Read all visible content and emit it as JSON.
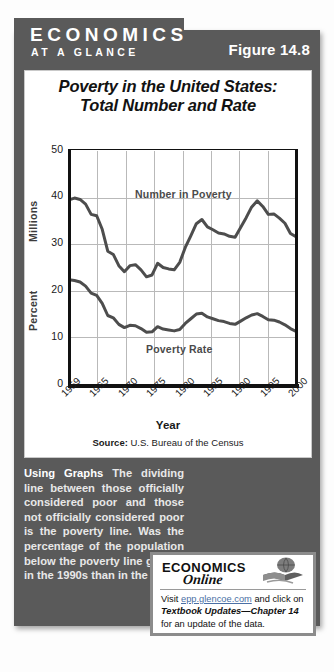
{
  "banner": {
    "title_line1": "ECONOMICS",
    "title_line2": "AT A GLANCE",
    "figure_label": "Figure 14.8"
  },
  "chart_card": {
    "title_line1": "Poverty in the United States:",
    "title_line2": "Total Number and Rate",
    "source_prefix": "Source:",
    "source_text": " U.S. Bureau of the Census"
  },
  "chart_data": {
    "type": "line",
    "title": "Poverty in the United States: Total Number and Rate",
    "xlabel": "Year",
    "ylabel_upper": "Millions",
    "ylabel_lower": "Percent",
    "ylim": [
      0,
      50
    ],
    "yticks": [
      50,
      40,
      30,
      20,
      10,
      0
    ],
    "xlim": [
      1959,
      2000
    ],
    "xticks": [
      1959,
      1965,
      1970,
      1975,
      1980,
      1985,
      1990,
      1995,
      2000
    ],
    "grid": true,
    "legend": "inline-annotations",
    "series": [
      {
        "name": "Number in Poverty",
        "unit": "Millions",
        "color": "#4d4d4d",
        "x": [
          1959,
          1960,
          1961,
          1962,
          1963,
          1964,
          1965,
          1966,
          1967,
          1968,
          1969,
          1970,
          1971,
          1972,
          1973,
          1974,
          1975,
          1976,
          1977,
          1978,
          1979,
          1980,
          1981,
          1982,
          1983,
          1984,
          1985,
          1986,
          1987,
          1988,
          1989,
          1990,
          1991,
          1992,
          1993,
          1994,
          1995,
          1996,
          1997,
          1998,
          1999,
          2000
        ],
        "values": [
          39.5,
          39.9,
          39.6,
          38.6,
          36.4,
          36.1,
          33.2,
          28.5,
          27.8,
          25.4,
          24.1,
          25.4,
          25.6,
          24.5,
          23.0,
          23.4,
          25.9,
          25.0,
          24.7,
          24.5,
          26.1,
          29.3,
          31.8,
          34.4,
          35.3,
          33.7,
          33.1,
          32.4,
          32.2,
          31.7,
          31.5,
          33.6,
          35.7,
          38.0,
          39.3,
          38.1,
          36.4,
          36.5,
          35.6,
          34.5,
          32.3,
          31.6
        ]
      },
      {
        "name": "Poverty Rate",
        "unit": "Percent",
        "color": "#4d4d4d",
        "x": [
          1959,
          1960,
          1961,
          1962,
          1963,
          1964,
          1965,
          1966,
          1967,
          1968,
          1969,
          1970,
          1971,
          1972,
          1973,
          1974,
          1975,
          1976,
          1977,
          1978,
          1979,
          1980,
          1981,
          1982,
          1983,
          1984,
          1985,
          1986,
          1987,
          1988,
          1989,
          1990,
          1991,
          1992,
          1993,
          1994,
          1995,
          1996,
          1997,
          1998,
          1999,
          2000
        ],
        "values": [
          22.4,
          22.2,
          21.9,
          21.0,
          19.5,
          19.0,
          17.3,
          14.7,
          14.2,
          12.8,
          12.1,
          12.6,
          12.5,
          11.9,
          11.1,
          11.2,
          12.3,
          11.8,
          11.6,
          11.4,
          11.7,
          13.0,
          14.0,
          15.0,
          15.2,
          14.4,
          14.0,
          13.6,
          13.4,
          13.0,
          12.8,
          13.5,
          14.2,
          14.8,
          15.1,
          14.5,
          13.8,
          13.7,
          13.3,
          12.7,
          11.9,
          11.3
        ]
      }
    ],
    "annotations": [
      {
        "text": "Number in Poverty",
        "x": 1977,
        "y": 41.5
      },
      {
        "text": "Poverty Rate",
        "x": 1977,
        "y": 8.5
      }
    ]
  },
  "caption": {
    "lead": "Using Graphs",
    "body": "   The dividing line between those officially considered poor and those not officially considered poor is the poverty line. Was the percentage of the population below the poverty line greater in the 1990s than in the 1980s?"
  },
  "online_box": {
    "brand_line1": "ECONOMICS",
    "brand_line2": "Online",
    "text_before_link": "Visit ",
    "link": "epp.glencoe.com",
    "text_after_link": " and click on ",
    "italic_text": "Textbook Updates—Chapter 14",
    "text_end": " for an update of the data."
  },
  "colors": {
    "frame": "#5a5a5a",
    "line": "#4d4d4d",
    "grid": "#b9b9b9",
    "link": "#4a6fa5"
  }
}
